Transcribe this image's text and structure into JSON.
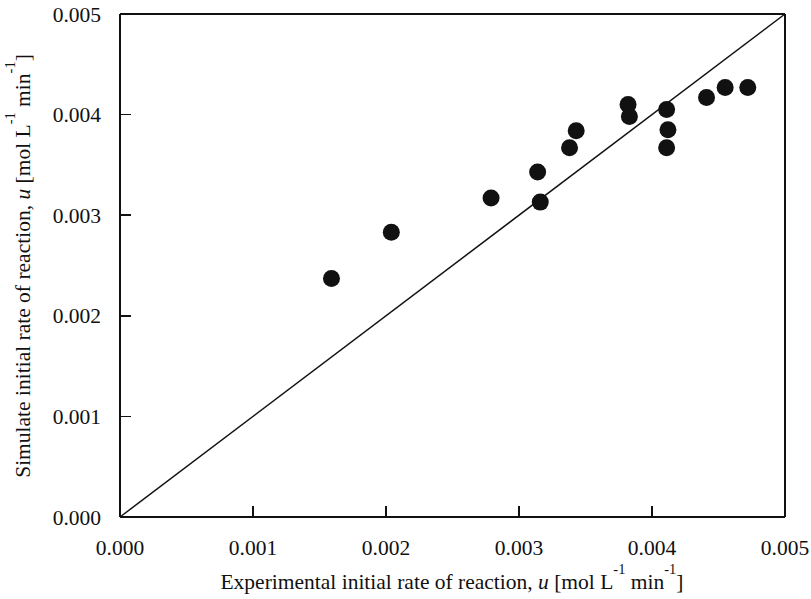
{
  "chart_data": {
    "type": "scatter",
    "title": "",
    "xlabel": "Experimental initial rate of reaction, u [mol L-1 min-1]",
    "ylabel": "Simulate initial rate of reaction, u [mol L-1 min-1]",
    "xlabel_parts": {
      "lead": "Experimental initial rate of reaction, ",
      "symbol": "u",
      "unit_open": " [mol L",
      "exp1": "-1",
      "unit_mid": " min",
      "exp2": "-1",
      "unit_close": "]"
    },
    "ylabel_parts": {
      "lead": "Simulate initial rate of reaction, ",
      "symbol": "u",
      "unit_open": " [mol L",
      "exp1": "-1",
      "unit_mid": " min",
      "exp2": "-1",
      "unit_close": "]"
    },
    "xlim": [
      0.0,
      0.005
    ],
    "ylim": [
      0.0,
      0.005
    ],
    "grid": false,
    "legend": null,
    "xticks": [
      0.0,
      0.001,
      0.002,
      0.003,
      0.004,
      0.005
    ],
    "yticks": [
      0.0,
      0.001,
      0.002,
      0.003,
      0.004,
      0.005
    ],
    "xticklabels": [
      "0.000",
      "0.001",
      "0.002",
      "0.003",
      "0.004",
      "0.005"
    ],
    "yticklabels": [
      "0.000",
      "0.001",
      "0.002",
      "0.003",
      "0.004",
      "0.005"
    ],
    "marker_style": "filled-circle",
    "marker_color": "#111111",
    "marker_radius_px": 8.5,
    "series": [
      {
        "name": "data points",
        "x": [
          0.00159,
          0.00204,
          0.00279,
          0.00314,
          0.00316,
          0.00338,
          0.00343,
          0.00382,
          0.00383,
          0.00411,
          0.00411,
          0.00412,
          0.00441,
          0.00455,
          0.00472
        ],
        "y": [
          0.00237,
          0.00283,
          0.00317,
          0.00343,
          0.00313,
          0.00367,
          0.00384,
          0.0041,
          0.00398,
          0.00405,
          0.00367,
          0.00385,
          0.00417,
          0.00427,
          0.00427
        ]
      }
    ],
    "reference_line": {
      "name": "parity line y = x",
      "x": [
        0.0,
        0.005
      ],
      "y": [
        0.0,
        0.005
      ],
      "color": "#111111"
    }
  }
}
